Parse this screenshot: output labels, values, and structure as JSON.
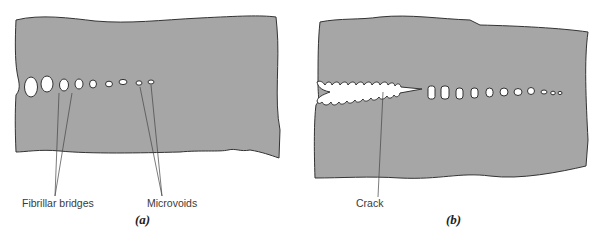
{
  "panels": [
    {
      "caption": "(a)",
      "labels": {
        "fibrillar_bridges": "Fibrillar bridges",
        "microvoids": "Microvoids"
      }
    },
    {
      "caption": "(b)",
      "labels": {
        "crack": "Crack"
      }
    }
  ],
  "colors": {
    "material": "#a6a6a6",
    "outline": "#333333",
    "void": "#ffffff",
    "background": "#ffffff"
  }
}
